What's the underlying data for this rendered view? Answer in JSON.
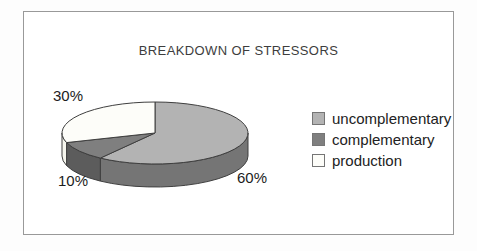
{
  "chart_data": {
    "type": "pie",
    "style": "3d",
    "title": "BREAKDOWN OF STRESSORS",
    "direction": "clockwise",
    "start_angle": "12-oclock",
    "legend_position": "right",
    "outline_color": "#3f3f3f",
    "frame_border_color": "#999999",
    "title_color": "#3d3d3d",
    "text_color": "#1c1c1c",
    "slices": [
      {
        "label": "uncomplementary",
        "value": 60,
        "pct_label": "60%",
        "color": "#b3b3b3",
        "side_color": "#757575"
      },
      {
        "label": "complementary",
        "value": 10,
        "pct_label": "10%",
        "color": "#7f7f7f",
        "side_color": "#5c5c5c"
      },
      {
        "label": "production",
        "value": 30,
        "pct_label": "30%",
        "color": "#fdfdf9",
        "side_color": "#f6f6ee"
      }
    ]
  }
}
